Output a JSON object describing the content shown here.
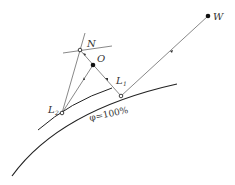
{
  "diagram": {
    "labels": {
      "W": "W",
      "N": "N",
      "O": "O",
      "L1_main": "L",
      "L1_sub": "1",
      "L2_main": "L",
      "L2_sub": "2",
      "phi": "φ=100%"
    },
    "colors": {
      "line": "#555555",
      "curve": "#222222",
      "point": "#111111",
      "background": "#ffffff"
    }
  }
}
